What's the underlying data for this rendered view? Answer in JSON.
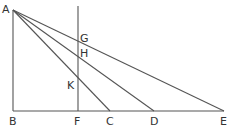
{
  "diagram": {
    "points": {
      "A": {
        "x": 13,
        "y": 10,
        "label": "A"
      },
      "B": {
        "x": 13,
        "y": 111,
        "label": "B"
      },
      "F": {
        "x": 78,
        "y": 111,
        "label": "F"
      },
      "C": {
        "x": 110,
        "y": 111,
        "label": "C"
      },
      "D": {
        "x": 154,
        "y": 111,
        "label": "D"
      },
      "E": {
        "x": 224,
        "y": 111,
        "label": "E"
      },
      "G": {
        "x": 78,
        "y": 41,
        "label": "G"
      },
      "H": {
        "x": 78,
        "y": 56,
        "label": "H"
      },
      "K": {
        "x": 78,
        "y": 84,
        "label": "K"
      }
    },
    "segments": [
      [
        "A",
        "B"
      ],
      [
        "B",
        "E"
      ],
      [
        "A",
        "C"
      ],
      [
        "A",
        "D"
      ],
      [
        "A",
        "E"
      ],
      [
        "F",
        "F_top"
      ]
    ],
    "vertical_line_top_y": 6
  }
}
